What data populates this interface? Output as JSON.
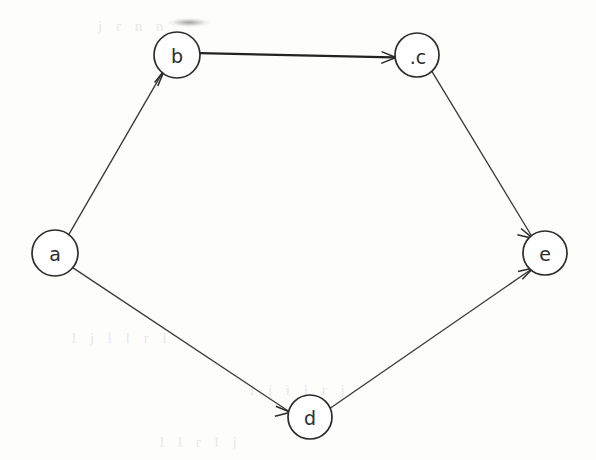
{
  "diagram": {
    "type": "directed-graph",
    "background_color": "#fdfdfc",
    "ink_color": "#2b2b2b",
    "node_radius": 22,
    "nodes": [
      {
        "id": "a",
        "label": "a",
        "cx": 55,
        "cy": 253,
        "r": 23,
        "in_degree": 0,
        "out_degree": 2
      },
      {
        "id": "b",
        "label": "b",
        "cx": 177,
        "cy": 55,
        "r": 23,
        "in_degree": 1,
        "out_degree": 1
      },
      {
        "id": "c",
        "label": ".c",
        "cx": 417,
        "cy": 55,
        "r": 22,
        "in_degree": 1,
        "out_degree": 1
      },
      {
        "id": "d",
        "label": "d",
        "cx": 310,
        "cy": 417,
        "r": 22,
        "in_degree": 1,
        "out_degree": 1
      },
      {
        "id": "e",
        "label": "e",
        "cx": 545,
        "cy": 253,
        "r": 22,
        "in_degree": 2,
        "out_degree": 0
      }
    ],
    "edges": [
      {
        "id": "a-b",
        "from": "a",
        "to": "b",
        "directed": true,
        "weight": "thin",
        "arrow_at": "b"
      },
      {
        "id": "b-c",
        "from": "b",
        "to": "c",
        "directed": true,
        "weight": "bold",
        "arrow_at": "c"
      },
      {
        "id": "c-e",
        "from": "c",
        "to": "e",
        "directed": true,
        "weight": "thin",
        "arrow_at": "e"
      },
      {
        "id": "a-d",
        "from": "a",
        "to": "d",
        "directed": true,
        "weight": "thin",
        "arrow_at": "d"
      },
      {
        "id": "d-e",
        "from": "d",
        "to": "e",
        "directed": true,
        "weight": "thin",
        "arrow_at": "e"
      }
    ],
    "artifacts": {
      "ghost_row_1": "j r n n",
      "ghost_row_2": "l j l l r l",
      "ghost_row_3": "i j i l r j",
      "ghost_row_4": "l l r l j"
    }
  }
}
